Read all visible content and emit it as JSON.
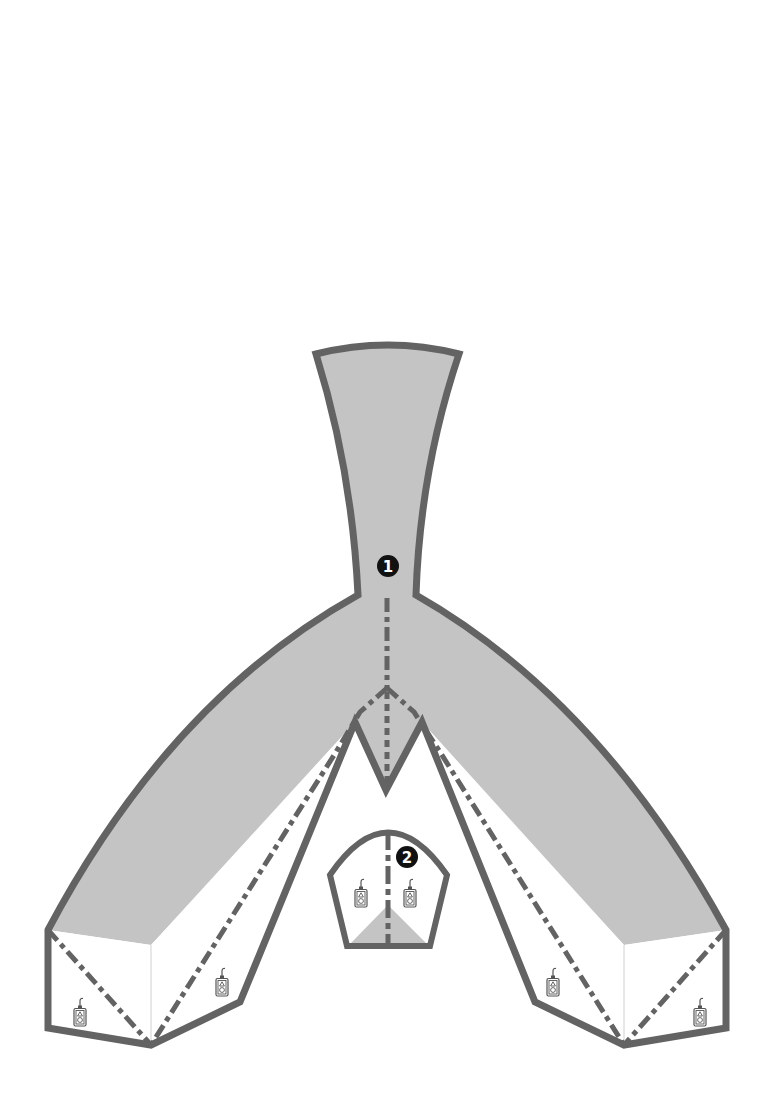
{
  "diagram": {
    "type": "floor-plan-layout",
    "colors": {
      "background": "#ffffff",
      "outline": "#636363",
      "shaded_area": "#c4c4c4",
      "marker_fill": "#111111",
      "marker_text": "#ffffff",
      "icon_stroke": "#555555",
      "face_edge": "#d0d0d0"
    },
    "markers": [
      {
        "id": "1",
        "label": "1",
        "glyph": "❶",
        "x": 388,
        "y": 566
      },
      {
        "id": "2",
        "label": "2",
        "glyph": "❷",
        "x": 407,
        "y": 857
      }
    ],
    "pendant_controls": [
      {
        "location": "center-room-left",
        "x": 361,
        "y": 893,
        "icon": "pendant-control-icon"
      },
      {
        "location": "center-room-right",
        "x": 410,
        "y": 893,
        "icon": "pendant-control-icon"
      },
      {
        "location": "left-wing-outer",
        "x": 80,
        "y": 1012,
        "icon": "pendant-control-icon"
      },
      {
        "location": "left-wing-inner",
        "x": 222,
        "y": 982,
        "icon": "pendant-control-icon"
      },
      {
        "location": "right-wing-inner",
        "x": 553,
        "y": 982,
        "icon": "pendant-control-icon"
      },
      {
        "location": "right-wing-outer",
        "x": 700,
        "y": 1012,
        "icon": "pendant-control-icon"
      }
    ],
    "lines": {
      "outline_style": "solid-thick",
      "centerline_style": "dash-dot"
    }
  }
}
